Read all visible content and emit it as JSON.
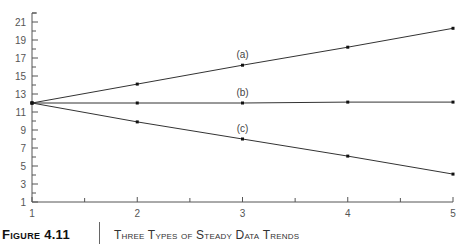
{
  "chart_data": {
    "type": "line",
    "title": "Three Types of Steady Data Trends",
    "xlabel": "",
    "ylabel": "",
    "x": [
      1,
      2,
      3,
      4,
      5
    ],
    "xlim": [
      1,
      5
    ],
    "ylim": [
      1,
      22
    ],
    "x_ticks": [
      1,
      2,
      3,
      4,
      5
    ],
    "y_ticks": [
      1,
      3,
      5,
      7,
      9,
      11,
      13,
      15,
      17,
      19,
      21
    ],
    "grid": false,
    "legend": "none (inline labels)",
    "series": [
      {
        "name": "(a)",
        "values": [
          12,
          14.1,
          16.2,
          18.2,
          20.3
        ],
        "label_at_x": 3
      },
      {
        "name": "(b)",
        "values": [
          12,
          12.0,
          12.0,
          12.1,
          12.1
        ],
        "label_at_x": 3
      },
      {
        "name": "(c)",
        "values": [
          12,
          9.9,
          8.0,
          6.1,
          4.1
        ],
        "label_at_x": 3
      }
    ]
  },
  "caption": {
    "figure_number": "Figure 4.11",
    "title": "Three Types of Steady Data Trends"
  },
  "colors": {
    "line": "#333333",
    "axis": "#555555",
    "text": "#555555"
  }
}
